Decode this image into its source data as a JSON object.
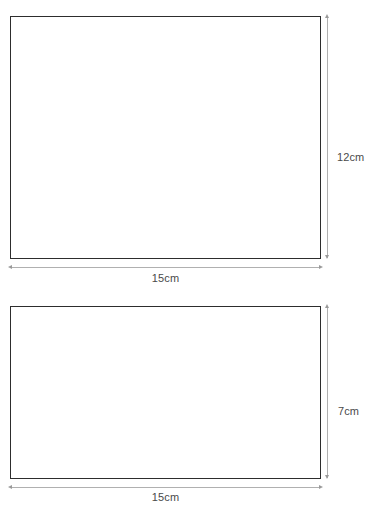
{
  "document": {
    "title": "Rectangle Dimensions Diagram",
    "background_color": "#ffffff",
    "shape_stroke_color": "#2d2d2d",
    "dimension_line_color": "#b0b0b0",
    "label_text_color": "#4a4a4a"
  },
  "figures": [
    {
      "name": "rectangle-1",
      "width_label": "15cm",
      "height_label": "12cm",
      "width_value": 15,
      "height_value": 12,
      "units": "cm"
    },
    {
      "name": "rectangle-2",
      "width_label": "15cm",
      "height_label": "7cm",
      "width_value": 15,
      "height_value": 7,
      "units": "cm"
    }
  ]
}
